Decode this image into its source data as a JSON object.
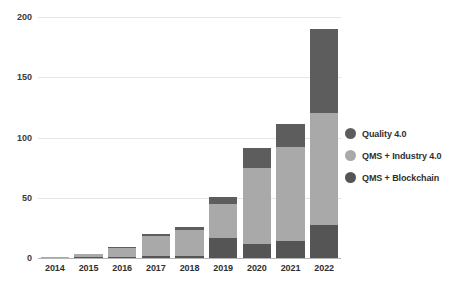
{
  "chart_data": {
    "type": "bar",
    "stacked": true,
    "title": "",
    "subtitle": "",
    "xlabel": "",
    "ylabel": "",
    "categories": [
      "2014",
      "2015",
      "2016",
      "2017",
      "2018",
      "2019",
      "2020",
      "2021",
      "2022"
    ],
    "series": [
      {
        "name": "QMS + Blockchain",
        "color": "#555555",
        "values": [
          0,
          1,
          1,
          2,
          2,
          17,
          12,
          14,
          27
        ]
      },
      {
        "name": "QMS + Industry 4.0",
        "color": "#a9a9a9",
        "values": [
          1,
          2,
          7,
          16,
          21,
          28,
          63,
          78,
          93
        ]
      },
      {
        "name": "Quality 4.0",
        "color": "#5d5d5d",
        "values": [
          0,
          0,
          1,
          2,
          3,
          6,
          16,
          19,
          70
        ]
      }
    ],
    "totals": [
      1,
      3,
      9,
      20,
      26,
      51,
      91,
      111,
      190
    ],
    "ylim": [
      0,
      200
    ],
    "yticks": [
      0,
      50,
      100,
      150,
      200
    ],
    "ytick_labels": [
      "0",
      "50",
      "100",
      "150",
      "200"
    ],
    "grid": true,
    "legend_position": "right",
    "legend": [
      {
        "label": "Quality 4.0",
        "color": "#5d5d5d"
      },
      {
        "label": "QMS + Industry 4.0",
        "color": "#a9a9a9"
      },
      {
        "label": "QMS + Blockchain",
        "color": "#555555"
      }
    ]
  }
}
